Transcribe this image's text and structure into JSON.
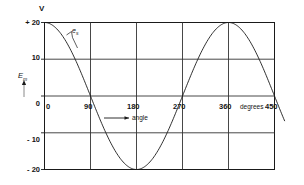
{
  "chart_data": {
    "type": "line",
    "title": "",
    "subtitle": "",
    "xlabel": "angle",
    "ylabel": "V",
    "x_unit": "degrees",
    "xlim": [
      0,
      450
    ],
    "ylim": [
      -20,
      20
    ],
    "grid": true,
    "legend": "none",
    "x_ticks": [
      "0",
      "90",
      "180",
      "270",
      "360",
      "450"
    ],
    "x_tick_values": [
      0,
      90,
      180,
      270,
      360,
      450
    ],
    "y_ticks": [
      "+ 20",
      "10",
      "0",
      "- 10",
      "- 20"
    ],
    "y_tick_values": [
      20,
      10,
      0,
      -10,
      -20
    ],
    "series": [
      {
        "name": "e",
        "expression": "v = 20 cos(angle)",
        "amplitude": 20,
        "period_degrees": 360,
        "phase_degrees": 0,
        "x": [
          0,
          15,
          30,
          45,
          60,
          75,
          90,
          105,
          120,
          135,
          150,
          165,
          180,
          195,
          210,
          225,
          240,
          255,
          270,
          285,
          300,
          315,
          330,
          345,
          360,
          375,
          390,
          405,
          420,
          435,
          450,
          465
        ],
        "values": [
          20.0,
          19.3,
          17.3,
          14.1,
          10.0,
          5.2,
          0.0,
          -5.2,
          -10.0,
          -14.1,
          -17.3,
          -19.3,
          -20.0,
          -19.3,
          -17.3,
          -14.1,
          -10.0,
          -5.2,
          0.0,
          5.2,
          10.0,
          14.1,
          17.3,
          19.3,
          20.0,
          19.3,
          17.3,
          14.1,
          10.0,
          5.2,
          0.0,
          -5.2
        ]
      }
    ],
    "annotations": [
      {
        "name": "curve-label",
        "text": "e",
        "subscript": "s"
      },
      {
        "name": "angle-arrow-label",
        "text": "angle"
      },
      {
        "name": "y-axis-quantity",
        "text": "E",
        "subscript": "m"
      }
    ]
  },
  "axes": {
    "unit_label": "V",
    "x_unit_label": "degrees",
    "x_arrow_label": "angle",
    "y_quantity": "E",
    "y_quantity_sub": "m",
    "curve_label": "e",
    "curve_label_sub": "s"
  },
  "colors": {
    "background": "#ffffff",
    "frame": "#1a1a1a",
    "grid": "#3a3a3a",
    "curve": "#1a1a1a",
    "text": "#141414"
  }
}
